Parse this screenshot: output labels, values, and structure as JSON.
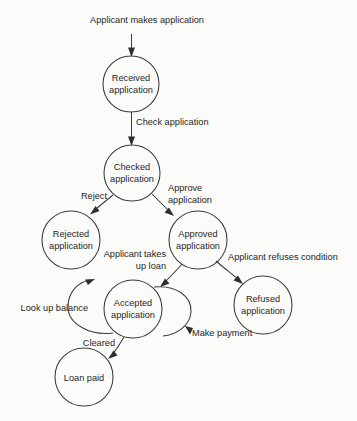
{
  "diagram": {
    "type": "uml-state-diagram",
    "canvas": {
      "width": 357,
      "height": 421
    },
    "style": {
      "background": "#fbfbf9",
      "stroke": "#3b3b3b",
      "text": "#262626",
      "arrow_fill": "#2e2e2e"
    },
    "nodes": [
      {
        "id": "received",
        "label_line1": "Received",
        "label_line2": "application",
        "cx": 131,
        "cy": 84,
        "r": 28
      },
      {
        "id": "checked",
        "label_line1": "Checked",
        "label_line2": "application",
        "cx": 132,
        "cy": 173,
        "r": 28
      },
      {
        "id": "rejected",
        "label_line1": "Rejected",
        "label_line2": "application",
        "cx": 71,
        "cy": 240,
        "r": 29
      },
      {
        "id": "approved",
        "label_line1": "Approved",
        "label_line2": "application",
        "cx": 198,
        "cy": 240,
        "r": 29
      },
      {
        "id": "accepted",
        "label_line1": "Accepted",
        "label_line2": "application",
        "cx": 133,
        "cy": 309,
        "r": 29
      },
      {
        "id": "refused",
        "label_line1": "Refused",
        "label_line2": "application",
        "cx": 263,
        "cy": 305,
        "r": 29
      },
      {
        "id": "loanpaid",
        "label_line1": "Loan paid",
        "label_line2": "",
        "cx": 84,
        "cy": 377,
        "r": 29
      }
    ],
    "edges": [
      {
        "id": "start-to-received",
        "label_line1": "Applicant makes application",
        "label_line2": "",
        "from": "start",
        "to": "received"
      },
      {
        "id": "received-to-checked",
        "label_line1": "Check application",
        "label_line2": "",
        "from": "received",
        "to": "checked"
      },
      {
        "id": "checked-to-rejected",
        "label_line1": "Reject",
        "label_line2": "",
        "from": "checked",
        "to": "rejected"
      },
      {
        "id": "checked-to-approved",
        "label_line1": "Approve",
        "label_line2": "application",
        "from": "checked",
        "to": "approved"
      },
      {
        "id": "approved-to-accepted",
        "label_line1": "Applicant takes",
        "label_line2": "up loan",
        "from": "approved",
        "to": "accepted"
      },
      {
        "id": "approved-to-refused",
        "label_line1": "Applicant refuses condition",
        "label_line2": "",
        "from": "approved",
        "to": "refused"
      },
      {
        "id": "accepted-lookup-loop",
        "label_line1": "Look up balance",
        "label_line2": "",
        "from": "accepted",
        "to": "accepted"
      },
      {
        "id": "accepted-payment-loop",
        "label_line1": "Make payment",
        "label_line2": "",
        "from": "accepted",
        "to": "accepted"
      },
      {
        "id": "accepted-to-loanpaid",
        "label_line1": "Cleared",
        "label_line2": "",
        "from": "accepted",
        "to": "loanpaid"
      }
    ]
  }
}
